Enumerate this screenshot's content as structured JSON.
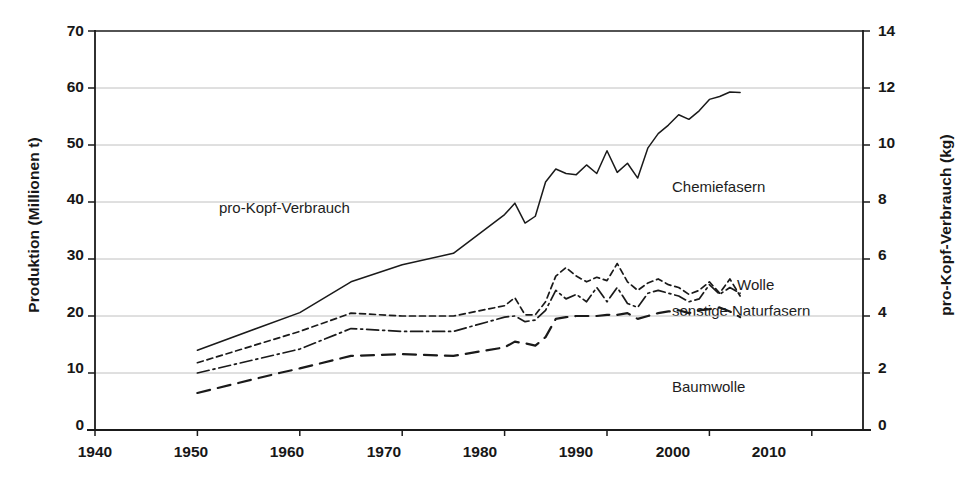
{
  "chart_data": {
    "type": "line",
    "title": "",
    "xlabel": "",
    "ylabel": "Produktion (Millionen t)",
    "ylabel_right": "pro-Kopf-Verbrauch (kg)",
    "xlim": [
      1940,
      2015
    ],
    "ylim": [
      0,
      70
    ],
    "ylim_right": [
      0,
      14
    ],
    "grid": true,
    "legend_position": "inline-annotations",
    "xticks": [
      1940,
      1950,
      1960,
      1970,
      1980,
      1990,
      2000,
      2010
    ],
    "yticks_left": [
      0,
      10,
      20,
      30,
      40,
      50,
      60,
      70
    ],
    "yticks_right": [
      0,
      2,
      4,
      6,
      8,
      10,
      12,
      14
    ],
    "annotations": [
      {
        "text": "pro-Kopf-Verbrauch",
        "x": 1959,
        "y": 41
      },
      {
        "text": "Chemiefasern",
        "x": 1997,
        "y": 37.5
      },
      {
        "text": "Wolle",
        "x": 2004,
        "y": 26.5
      },
      {
        "text": "sonstige Naturfasern",
        "x": 2004,
        "y": 22.5
      },
      {
        "text": "Baumwolle",
        "x": 1998,
        "y": 11.5
      }
    ],
    "series": [
      {
        "name": "pro-Kopf-Verbrauch",
        "style": "thick-solid",
        "axis": "right",
        "x": [
          1950,
          1965,
          1970,
          1975,
          1980,
          1981,
          1982,
          1983,
          1984,
          1985,
          1986,
          1987,
          1988,
          1989,
          1990,
          1991,
          1992,
          1993,
          1994,
          1995,
          1996,
          1997,
          1998,
          1999,
          2000,
          2001,
          2002,
          2003
        ],
        "y": [
          22.5,
          35.3,
          35.0,
          34.5,
          39.2,
          41.3,
          38.5,
          38.0,
          43.7,
          45.8,
          45.5,
          44.0,
          45.3,
          44.0,
          48.0,
          44.3,
          45.8,
          40.8,
          43.5,
          45.3,
          44.3,
          45.5,
          45.3,
          46.5,
          46.0,
          47.3,
          48.0,
          47.0
        ]
      },
      {
        "name": "Gesamtproduktion",
        "style": "thin-solid",
        "axis": "left",
        "x": [
          1950,
          1960,
          1965,
          1970,
          1975,
          1980,
          1981,
          1982,
          1983,
          1984,
          1985,
          1986,
          1987,
          1988,
          1989,
          1990,
          1991,
          1992,
          1993,
          1994,
          1995,
          1996,
          1997,
          1998,
          1999,
          2000,
          2001,
          2002,
          2003
        ],
        "y": [
          14.0,
          20.6,
          26.0,
          29.0,
          31.0,
          37.8,
          39.8,
          36.3,
          37.5,
          43.5,
          45.8,
          45.0,
          44.8,
          46.5,
          45.0,
          49.0,
          45.2,
          46.8,
          44.2,
          49.5,
          52.0,
          53.5,
          55.3,
          54.5,
          56.0,
          58.0,
          58.5,
          59.3,
          59.2
        ]
      },
      {
        "name": "Chemiefasern",
        "style": "short-dash",
        "axis": "left",
        "x": [
          1950,
          1960,
          1965,
          1970,
          1975,
          1980,
          1981,
          1982,
          1983,
          1984,
          1985,
          1986,
          1987,
          1988,
          1989,
          1990,
          1991,
          1992,
          1993,
          1994,
          1995,
          1996,
          1997,
          1998,
          1999,
          2000,
          2001,
          2002,
          2003
        ],
        "y": [
          11.8,
          17.3,
          20.5,
          20.0,
          20.0,
          21.8,
          23.2,
          20.2,
          20.2,
          22.5,
          27.0,
          28.5,
          27.0,
          26.0,
          26.8,
          26.2,
          29.2,
          26.0,
          24.5,
          25.8,
          26.5,
          25.5,
          25.0,
          23.8,
          24.5,
          26.0,
          24.0,
          26.5,
          23.5
        ]
      },
      {
        "name": "Wolle",
        "style": "dash-dot",
        "axis": "left",
        "x": [
          1950,
          1960,
          1965,
          1970,
          1975,
          1980,
          1981,
          1982,
          1983,
          1984,
          1985,
          1986,
          1987,
          1988,
          1989,
          1990,
          1991,
          1992,
          1993,
          1994,
          1995,
          1996,
          1997,
          1998,
          1999,
          2000,
          2001,
          2002,
          2003
        ],
        "y": [
          10.0,
          14.2,
          17.8,
          17.3,
          17.3,
          19.8,
          20.0,
          19.0,
          19.3,
          21.0,
          24.5,
          23.0,
          23.8,
          22.5,
          25.0,
          22.5,
          25.0,
          22.2,
          21.5,
          24.0,
          24.5,
          24.0,
          23.5,
          22.5,
          23.0,
          25.5,
          23.8,
          25.0,
          24.0
        ]
      },
      {
        "name": "Baumwolle",
        "style": "long-dash",
        "axis": "left",
        "x": [
          1950,
          1958,
          1960,
          1965,
          1970,
          1975,
          1980,
          1981,
          1982,
          1983,
          1984,
          1985,
          1986,
          1987,
          1988,
          1989,
          1990,
          1991,
          1992,
          1993,
          1994,
          1995,
          1996,
          1997,
          1998,
          1999,
          2000,
          2001,
          2002,
          2003
        ],
        "y": [
          6.5,
          10.0,
          10.8,
          13.0,
          13.3,
          13.0,
          14.5,
          15.5,
          15.2,
          14.8,
          16.3,
          19.5,
          19.8,
          20.0,
          20.0,
          20.0,
          20.2,
          20.2,
          20.5,
          19.5,
          20.0,
          20.5,
          20.8,
          21.0,
          20.5,
          21.0,
          21.2,
          21.5,
          20.8,
          19.8
        ]
      }
    ]
  },
  "ticks": {
    "x": [
      "1940",
      "1950",
      "1960",
      "1970",
      "1980",
      "1990",
      "2000",
      "2010"
    ],
    "y_left": [
      "70",
      "60",
      "50",
      "40",
      "30",
      "20",
      "10",
      "0"
    ],
    "y_right": [
      "14",
      "12",
      "10",
      "8",
      "6",
      "4",
      "2",
      "0"
    ]
  },
  "labels": {
    "y_left_title": "Produktion (Millionen t)",
    "y_right_title": "pro-Kopf-Verbrauch (kg)",
    "pro_kopf": "pro-Kopf-Verbrauch",
    "chemiefasern": "Chemiefasern",
    "wolle": "Wolle",
    "sonstige": "sonstige Naturfasern",
    "baumwolle": "Baumwolle"
  },
  "colors": {
    "ink": "#1a1a1a",
    "grid": "#b9b9b9",
    "background": "#ffffff"
  }
}
